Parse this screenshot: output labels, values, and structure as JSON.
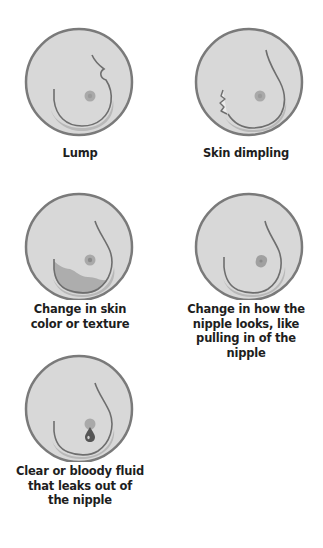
{
  "colors": {
    "background": "#ffffff",
    "circle_fill": "#d8d8d8",
    "circle_stroke": "#7a7a7a",
    "contour": "#6e6e6e",
    "shadow": "#b8b8b8",
    "nipple": "#a9a9a9",
    "caption_text": "#1e1e1e"
  },
  "signs": [
    {
      "id": "lump",
      "label": "Lump"
    },
    {
      "id": "skin-dimpling",
      "label": "Skin dimpling"
    },
    {
      "id": "skin-color-texture",
      "label_lines": [
        "Change in skin",
        "color or texture"
      ]
    },
    {
      "id": "nipple-change",
      "label_lines": [
        "Change in how the",
        "nipple looks, like",
        "pulling in of the",
        "nipple"
      ]
    },
    {
      "id": "nipple-fluid",
      "label_lines": [
        "Clear or bloody fluid",
        "that leaks out of",
        "the nipple"
      ]
    }
  ]
}
